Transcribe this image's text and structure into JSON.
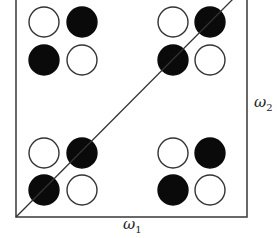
{
  "diagram": {
    "frame": {
      "x1": 16,
      "y1": -2,
      "x2": 247,
      "y2": 217,
      "stroke": "#444444"
    },
    "diagonal": {
      "x1": 16,
      "y1": 217,
      "x2": 234,
      "y2": -2,
      "stroke": "#333333"
    },
    "circle_radius": 15,
    "colors": {
      "filled": "#0a0a0a",
      "open_fill": "#ffffff",
      "outline": "#333333"
    },
    "groups": [
      {
        "name": "top-left",
        "circles": [
          {
            "cx": 44,
            "cy": 22,
            "filled": false
          },
          {
            "cx": 82,
            "cy": 22,
            "filled": true
          },
          {
            "cx": 44,
            "cy": 60,
            "filled": true
          },
          {
            "cx": 82,
            "cy": 60,
            "filled": false
          }
        ]
      },
      {
        "name": "top-right",
        "circles": [
          {
            "cx": 173,
            "cy": 22,
            "filled": false
          },
          {
            "cx": 210,
            "cy": 22,
            "filled": true
          },
          {
            "cx": 173,
            "cy": 60,
            "filled": true
          },
          {
            "cx": 210,
            "cy": 60,
            "filled": false
          }
        ]
      },
      {
        "name": "bottom-left",
        "circles": [
          {
            "cx": 44,
            "cy": 153,
            "filled": false
          },
          {
            "cx": 82,
            "cy": 153,
            "filled": true
          },
          {
            "cx": 44,
            "cy": 190,
            "filled": true
          },
          {
            "cx": 82,
            "cy": 190,
            "filled": false
          }
        ]
      },
      {
        "name": "bottom-right",
        "circles": [
          {
            "cx": 173,
            "cy": 153,
            "filled": false
          },
          {
            "cx": 210,
            "cy": 153,
            "filled": true
          },
          {
            "cx": 173,
            "cy": 190,
            "filled": true
          },
          {
            "cx": 210,
            "cy": 190,
            "filled": false
          }
        ]
      }
    ]
  },
  "labels": {
    "x_axis": {
      "symbol": "ω",
      "subscript": "1"
    },
    "y_axis": {
      "symbol": "ω",
      "subscript": "2"
    }
  }
}
